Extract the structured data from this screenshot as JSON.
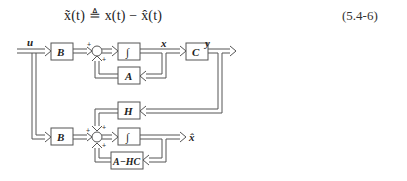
{
  "equation": {
    "lhs": "x̃(t)",
    "relation": "≜",
    "rhs": "x(t) − x̂(t)",
    "number": "(5.4-6)"
  },
  "diagram": {
    "signals": {
      "input": "u",
      "state": "x",
      "output": "y",
      "estimate": "x̂"
    },
    "plant": {
      "input_gain": "B",
      "integrator": "∫",
      "feedback": "A",
      "output_gain": "C",
      "sum_signs": [
        "+",
        "+"
      ]
    },
    "observer": {
      "input_gain": "B",
      "integrator": "∫",
      "feedback": "A−HC",
      "injection_gain": "H",
      "sum_signs": [
        "+",
        "+",
        "+"
      ]
    }
  }
}
